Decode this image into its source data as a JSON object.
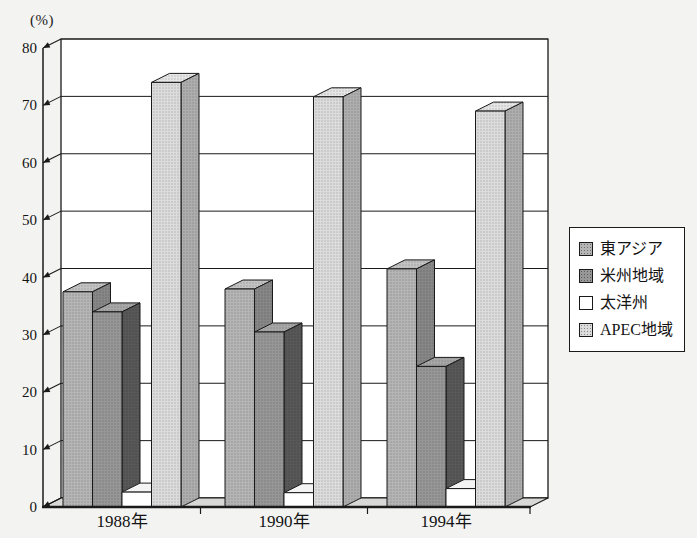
{
  "page": {
    "background": "#f3f3f1"
  },
  "unit_label": "(%)",
  "chart_data": {
    "type": "bar",
    "projection": "3d-oblique",
    "title": "",
    "xlabel": "",
    "ylabel": "(%)",
    "ylim": [
      0,
      80
    ],
    "ytick_step": 10,
    "grid": true,
    "legend_position": "right",
    "categories": [
      "1988年",
      "1990年",
      "1994年"
    ],
    "series": [
      {
        "name": "東アジア",
        "values": [
          37.5,
          38.0,
          41.5
        ],
        "color": "#b5b5b5",
        "side": "#878787",
        "top": "#c3c3c3",
        "halftone": true
      },
      {
        "name": "米州地域",
        "values": [
          34.0,
          30.5,
          24.5
        ],
        "color": "#979797",
        "side": "#585858",
        "top": "#a8a8a8",
        "halftone": true
      },
      {
        "name": "太洋州",
        "values": [
          2.6,
          2.5,
          3.2
        ],
        "color": "#ffffff",
        "side": "#e2e2e2",
        "top": "#f4f4f4",
        "halftone": false
      },
      {
        "name": "APEC地域",
        "values": [
          74.0,
          71.5,
          69.0
        ],
        "color": "#dcdcdc",
        "side": "#aeaeae",
        "top": "#e6e6e6",
        "halftone": true
      }
    ],
    "colors": {
      "axis_line": "#1a1a1a",
      "wall_fill": "#ffffff",
      "floor_fill": "#d8d8d6",
      "text": "#141414"
    }
  }
}
